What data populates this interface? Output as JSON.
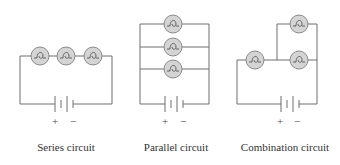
{
  "diagram": {
    "circuits": [
      {
        "id": "series",
        "caption": "Series circuit",
        "bulb_count": 3,
        "battery": {
          "plus": "+",
          "minus": "−"
        }
      },
      {
        "id": "parallel",
        "caption": "Parallel circuit",
        "bulb_count": 3,
        "battery": {
          "plus": "+",
          "minus": "−"
        }
      },
      {
        "id": "combination",
        "caption": "Combination circuit",
        "bulb_count": 3,
        "battery": {
          "plus": "+",
          "minus": "−"
        }
      }
    ],
    "colors": {
      "wire": "#6e6e6e",
      "bulb_fill": "#d4d4d4",
      "bulb_stroke": "#8a8a8a",
      "text": "#333333"
    }
  }
}
